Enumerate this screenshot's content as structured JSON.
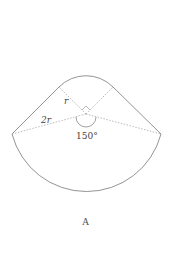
{
  "figure": {
    "labels": {
      "small_radius": "r",
      "large_radius": "2r",
      "angle": "150°"
    },
    "caption": "A",
    "colors": {
      "stroke": "#888888",
      "dashed": "#aaaaaa"
    }
  }
}
